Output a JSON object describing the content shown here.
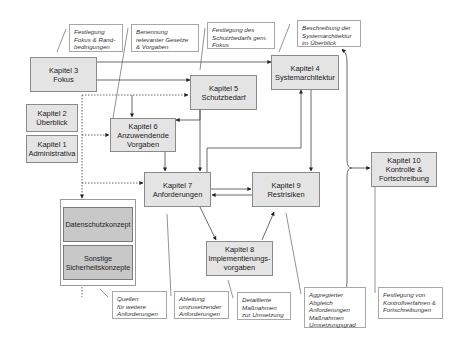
{
  "diagram": {
    "chapters": [
      {
        "id": "k3",
        "title": "Kapitel 3",
        "subtitle": [
          "Fokus"
        ]
      },
      {
        "id": "k5",
        "title": "Kapitel 5",
        "subtitle": [
          "Schutzbedarf"
        ]
      },
      {
        "id": "k4",
        "title": "Kapitel 4",
        "subtitle": [
          "Systemarchitektur"
        ]
      },
      {
        "id": "k2",
        "title": "Kapitel 2",
        "subtitle": [
          "Überblick"
        ]
      },
      {
        "id": "k1",
        "title": "Kapitel 1",
        "subtitle": [
          "Administrativa"
        ]
      },
      {
        "id": "k6",
        "title": "Kapitel 6",
        "subtitle": [
          "Anzuwendende",
          "Vorgaben"
        ]
      },
      {
        "id": "k7",
        "title": "Kapitel 7",
        "subtitle": [
          "Anforderungen"
        ]
      },
      {
        "id": "k9",
        "title": "Kapitel 9",
        "subtitle": [
          "Restrisiken"
        ]
      },
      {
        "id": "k10",
        "title": "Kapitel 10",
        "subtitle": [
          "Kontrolle  &",
          "Fortschreibung"
        ]
      },
      {
        "id": "k8",
        "title": "Kapitel 8",
        "subtitle": [
          "Implementierungs-",
          "vorgaben"
        ]
      }
    ],
    "concepts": [
      {
        "lines": [
          "Datenschutzkonzept"
        ]
      },
      {
        "lines": [
          "Sonstige",
          "Sicherheitskonzepte"
        ]
      }
    ],
    "notes": [
      {
        "id": "n-fokus",
        "lines": [
          "Festlegung",
          "Fokus & Rand-",
          "bedingungen"
        ]
      },
      {
        "id": "n-gesetze",
        "lines": [
          "Benennung",
          "relevanter Gesetze",
          "& Vorgaben"
        ]
      },
      {
        "id": "n-schutzbedarf",
        "lines": [
          "Festlegung des",
          "Schutzbedarfs gem.",
          "Fokus"
        ]
      },
      {
        "id": "n-systemarch",
        "lines": [
          "Beschreibung der",
          "Systemarchitektur",
          "im Überblick"
        ]
      },
      {
        "id": "n-quellen",
        "lines": [
          "Quellen",
          "für weitere",
          "Anforderungen"
        ]
      },
      {
        "id": "n-ableitung",
        "lines": [
          "Ableitung",
          "umzusetzender",
          "Anforderungen"
        ]
      },
      {
        "id": "n-massnahmen",
        "lines": [
          "Detaillierte",
          "Maßnahmen",
          "zur Umsetzung"
        ]
      },
      {
        "id": "n-aggregiert",
        "lines": [
          "Aggregierter",
          "Abgleich",
          "Anforderungen",
          "Maßnahmen",
          "Umsetzungsgrad"
        ]
      },
      {
        "id": "n-kontrolle",
        "lines": [
          "Festlegung von",
          "Kontrollverfahren &",
          "Fortschreibungen"
        ]
      }
    ],
    "colors": {
      "chapter_fill": "#e4e4e4",
      "concept_fill": "#c8c8c8",
      "line": "#333333",
      "note_border": "#a8a8a8"
    }
  }
}
